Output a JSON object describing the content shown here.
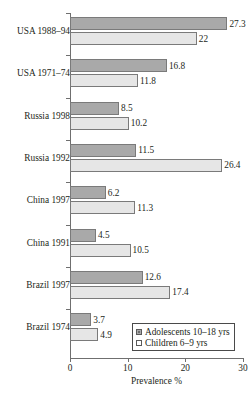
{
  "chart_data": {
    "type": "bar",
    "orientation": "horizontal",
    "title": "",
    "xlabel": "Prevalence %",
    "ylabel": "",
    "xlim": [
      0,
      30
    ],
    "xticks": [
      0,
      10,
      20,
      30
    ],
    "grid": false,
    "legend_position": "bottom-right",
    "categories": [
      "USA 1988–94",
      "USA 1971–74",
      "Russia 1998",
      "Russia 1992",
      "China 1997",
      "China 1991",
      "Brazil 1997",
      "Brazil 1974"
    ],
    "series": [
      {
        "name": "Adolescents 10–18 yrs",
        "color": "#a9a9a9",
        "values": [
          27.3,
          16.8,
          8.5,
          11.5,
          6.2,
          4.5,
          12.6,
          3.7
        ],
        "labels": [
          "27.3",
          "16.8",
          "8.5",
          "11.5",
          "6.2",
          "4.5",
          "12.6",
          "3.7"
        ]
      },
      {
        "name": "Children 6–9 yrs",
        "color": "#e6e6e6",
        "values": [
          22,
          11.8,
          10.2,
          26.4,
          11.3,
          10.5,
          17.4,
          4.9
        ],
        "labels": [
          "22",
          "11.8",
          "10.2",
          "26.4",
          "11.3",
          "10.5",
          "17.4",
          "4.9"
        ]
      }
    ]
  },
  "legend": {
    "entries": [
      {
        "label": "Adolescents 10–18 yrs",
        "swatch": "dark-gray-square-icon"
      },
      {
        "label": "Children 6–9 yrs",
        "swatch": "light-gray-square-icon"
      }
    ]
  },
  "axis": {
    "x_title": "Prevalence %",
    "x_tick_labels": [
      "0",
      "10",
      "20",
      "30"
    ]
  }
}
